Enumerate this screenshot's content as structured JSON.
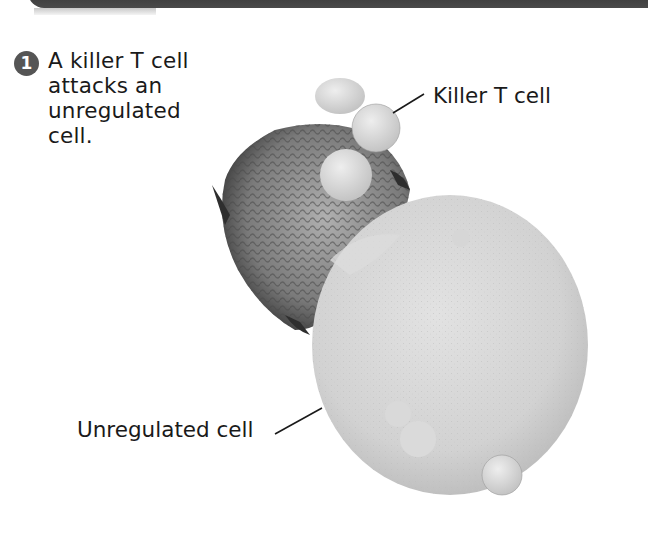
{
  "header": {
    "band_color": "#3a3a3a"
  },
  "step": {
    "number": "1",
    "badge_color": "#555555",
    "caption_lines": [
      "A killer T cell",
      "attacks an",
      "unregulated",
      "cell."
    ]
  },
  "figure": {
    "type": "scanning electron micrograph",
    "labels": {
      "killer_t_cell": "Killer T cell",
      "unregulated_cell": "Unregulated cell"
    }
  }
}
